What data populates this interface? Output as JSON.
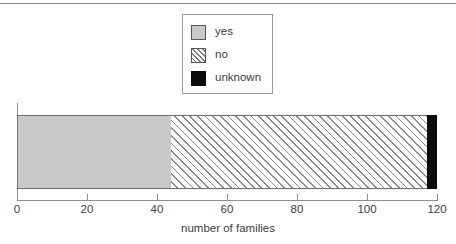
{
  "chart_data": {
    "type": "bar",
    "orientation": "horizontal",
    "stacked": true,
    "title": "",
    "xlabel": "number of families",
    "ylabel": "",
    "xlim": [
      0,
      120
    ],
    "xticks": [
      0,
      20,
      40,
      60,
      80,
      100,
      120
    ],
    "xtick_labels": [
      "0",
      "20",
      "40",
      "60",
      "80",
      "100",
      "120"
    ],
    "grid": false,
    "legend_position": "top-center",
    "categories": [
      ""
    ],
    "series": [
      {
        "name": "yes",
        "values": [
          44
        ],
        "color": "#c9c9c9",
        "fill": "solid"
      },
      {
        "name": "no",
        "values": [
          73
        ],
        "color": "#ffffff",
        "fill": "diagonal-hatch"
      },
      {
        "name": "unknown",
        "values": [
          3
        ],
        "color": "#0b0b0b",
        "fill": "solid"
      }
    ],
    "cumulative_edges": [
      0,
      44,
      117,
      120
    ],
    "total": 120
  },
  "legend": {
    "items": [
      {
        "label": "yes",
        "swatch": "solid-gray-swatch"
      },
      {
        "label": "no",
        "swatch": "hatched-swatch"
      },
      {
        "label": "unknown",
        "swatch": "solid-black-swatch"
      }
    ]
  },
  "axis": {
    "x_title": "number of families",
    "tick_labels": [
      "0",
      "20",
      "40",
      "60",
      "80",
      "100",
      "120"
    ]
  },
  "colors": {
    "yes": "#c9c9c9",
    "unknown": "#0b0b0b",
    "hatch_line": "#8a8a8a",
    "axis": "#8e8e8e",
    "text": "#3d3d3d",
    "rule": "#8a8a8a"
  }
}
